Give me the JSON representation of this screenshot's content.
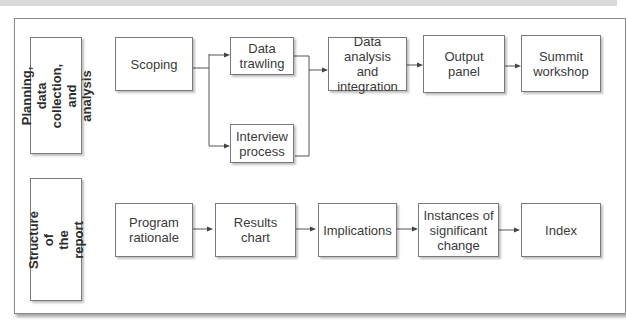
{
  "diagram": {
    "rows": [
      {
        "label": "Planning,\ndata collection,\nand analysis",
        "nodes": [
          {
            "id": "scoping",
            "text": "Scoping"
          },
          {
            "id": "data-trawling",
            "text": "Data\ntrawling"
          },
          {
            "id": "interview-process",
            "text": "Interview\nprocess"
          },
          {
            "id": "data-analysis",
            "text": "Data analysis\nand\nintegration"
          },
          {
            "id": "output-panel",
            "text": "Output\npanel"
          },
          {
            "id": "summit-workshop",
            "text": "Summit\nworkshop"
          }
        ],
        "edges": [
          [
            "scoping",
            "data-trawling"
          ],
          [
            "scoping",
            "interview-process"
          ],
          [
            "data-trawling",
            "data-analysis"
          ],
          [
            "interview-process",
            "data-analysis"
          ],
          [
            "data-analysis",
            "output-panel"
          ],
          [
            "output-panel",
            "summit-workshop"
          ]
        ]
      },
      {
        "label": "Structure of\nthe report",
        "nodes": [
          {
            "id": "program-rationale",
            "text": "Program\nrationale"
          },
          {
            "id": "results-chart",
            "text": "Results\nchart"
          },
          {
            "id": "implications",
            "text": "Implications"
          },
          {
            "id": "instances",
            "text": "Instances of\nsignificant\nchange"
          },
          {
            "id": "index",
            "text": "Index"
          }
        ],
        "edges": [
          [
            "program-rationale",
            "results-chart"
          ],
          [
            "results-chart",
            "implications"
          ],
          [
            "implications",
            "instances"
          ],
          [
            "instances",
            "index"
          ]
        ]
      }
    ]
  }
}
